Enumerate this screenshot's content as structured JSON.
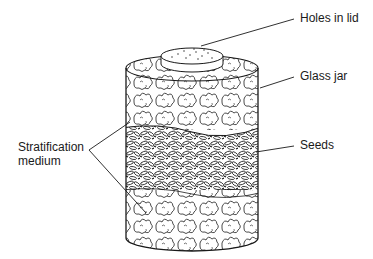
{
  "figure": {
    "colors": {
      "ink": "#1a1a1a",
      "background": "#ffffff"
    },
    "labels": {
      "holes_in_lid": "Holes in lid",
      "glass_jar": "Glass jar",
      "seeds": "Seeds",
      "stratification_line1": "Stratification",
      "stratification_line2": "medium"
    },
    "layers": [
      {
        "name": "Stratification medium",
        "position": "top"
      },
      {
        "name": "Seeds",
        "position": "middle"
      },
      {
        "name": "Stratification medium",
        "position": "bottom"
      }
    ]
  }
}
